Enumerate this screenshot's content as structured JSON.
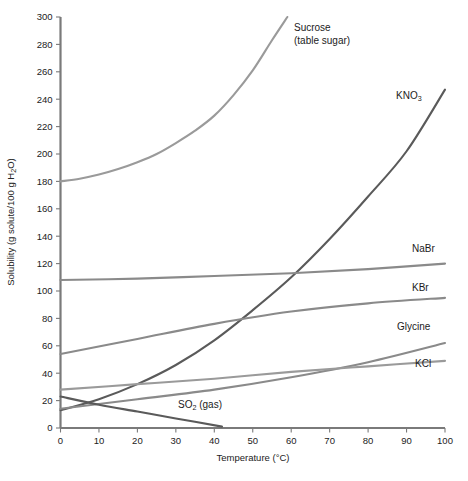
{
  "chart_data": {
    "type": "line",
    "title": "",
    "xlabel": "Temperature (°C)",
    "ylabel": "Solubility (g solute/100 g H₂O)",
    "xlim": [
      0,
      100
    ],
    "ylim": [
      0,
      300
    ],
    "xticks": [
      0,
      10,
      20,
      30,
      40,
      50,
      60,
      70,
      80,
      90,
      100
    ],
    "yticks": [
      0,
      20,
      40,
      60,
      80,
      100,
      120,
      140,
      160,
      180,
      200,
      220,
      240,
      260,
      280,
      300
    ],
    "grid": false,
    "legend": "inline-right-labels",
    "series": [
      {
        "name": "Sucrose",
        "label": "Sucrose",
        "label_line2": "(table sugar)",
        "color": "#9a9a9a",
        "x": [
          0,
          5,
          10,
          15,
          20,
          25,
          30,
          35,
          40,
          45,
          50,
          55,
          59
        ],
        "values": [
          180,
          182,
          185,
          189,
          194,
          200,
          208,
          217,
          228,
          243,
          261,
          283,
          300
        ]
      },
      {
        "name": "KNO3",
        "label": "KNO",
        "label_sub": "3",
        "color": "#5a5a5a",
        "x": [
          0,
          10,
          20,
          30,
          40,
          50,
          60,
          70,
          80,
          90,
          100
        ],
        "values": [
          13,
          21,
          32,
          46,
          64,
          86,
          110,
          138,
          169,
          202,
          247
        ]
      },
      {
        "name": "NaBr",
        "label": "NaBr",
        "color": "#8a8a8a",
        "x": [
          0,
          20,
          40,
          60,
          80,
          100
        ],
        "values": [
          108,
          109,
          111,
          113,
          116,
          120
        ]
      },
      {
        "name": "KBr",
        "label": "KBr",
        "color": "#8a8a8a",
        "x": [
          0,
          20,
          40,
          60,
          80,
          100
        ],
        "values": [
          54,
          65,
          76,
          85,
          91,
          95
        ]
      },
      {
        "name": "Glycine",
        "label": "Glycine",
        "color": "#8a8a8a",
        "x": [
          0,
          20,
          40,
          60,
          80,
          100
        ],
        "values": [
          14,
          21,
          28,
          37,
          48,
          62
        ]
      },
      {
        "name": "KCl",
        "label": "KCl",
        "color": "#9a9a9a",
        "x": [
          0,
          20,
          40,
          60,
          80,
          100
        ],
        "values": [
          28,
          32,
          36,
          41,
          45,
          49
        ]
      },
      {
        "name": "SO2 (gas)",
        "label": "SO",
        "label_sub": "2",
        "label_tail": " (gas)",
        "color": "#5a5a5a",
        "x": [
          0,
          10,
          20,
          30,
          42
        ],
        "values": [
          23,
          17,
          12,
          7,
          1
        ]
      }
    ],
    "annotations": [
      {
        "text": "Sucrose",
        "x_px": 294,
        "y_px": 28
      },
      {
        "text": "(table sugar)",
        "x_px": 294,
        "y_px": 41
      },
      {
        "text": "KNO3",
        "x_px": 396,
        "y_px": 95
      },
      {
        "text": "NaBr",
        "x_px": 412,
        "y_px": 249
      },
      {
        "text": "KBr",
        "x_px": 412,
        "y_px": 288
      },
      {
        "text": "Glycine",
        "x_px": 397,
        "y_px": 327
      },
      {
        "text": "KCl",
        "x_px": 415,
        "y_px": 364
      },
      {
        "text": "SO2 (gas)",
        "x_px": 178,
        "y_px": 404
      }
    ]
  },
  "axis": {
    "x_title": "Temperature (°C)",
    "y_title_prefix": "Solubility (g solute/100 g H",
    "y_title_sub": "2",
    "y_title_suffix": "O)"
  },
  "labels": {
    "sucrose_line1": "Sucrose",
    "sucrose_line2": "(table sugar)",
    "kno3_base": "KNO",
    "kno3_sub": "3",
    "nabr": "NaBr",
    "kbr": "KBr",
    "glycine": "Glycine",
    "kcl": "KCl",
    "so2_base": "SO",
    "so2_sub": "2",
    "so2_tail": " (gas)"
  },
  "ticks": {
    "x": [
      "0",
      "10",
      "20",
      "30",
      "40",
      "50",
      "60",
      "70",
      "80",
      "90",
      "100"
    ],
    "y": [
      "0",
      "20",
      "40",
      "60",
      "80",
      "100",
      "120",
      "140",
      "160",
      "180",
      "200",
      "220",
      "240",
      "260",
      "280",
      "300"
    ]
  },
  "colors": {
    "axis": "#7a7a7a",
    "text": "#222222",
    "dark_series": "#5a5a5a",
    "mid_series": "#8a8a8a",
    "light_series": "#9a9a9a",
    "background": "#ffffff"
  }
}
